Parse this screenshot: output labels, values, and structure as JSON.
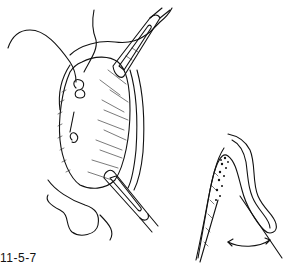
{
  "figure": {
    "caption": "11-5-7",
    "main_illustration": "surgical-view-with-retractors-and-suture",
    "inset_illustration": "cross-section-tissue-with-angle-arrow",
    "colors": {
      "line": "#111111",
      "background": "#ffffff"
    }
  }
}
